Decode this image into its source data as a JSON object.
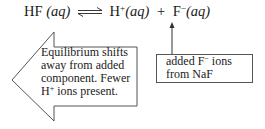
{
  "equation": {
    "reactant": "HF",
    "reactant_state": "(aq)",
    "equilibrium_symbol": "double-harpoon",
    "product1": "H",
    "product1_charge": "+",
    "product1_state": "(aq)",
    "plus": "+",
    "product2": "F",
    "product2_charge": "−",
    "product2_state": "(aq)"
  },
  "shift_arrow": {
    "direction": "left",
    "line1": "Equilibrium shifts",
    "line2": "away from added",
    "line3": "component. Fewer",
    "line4_prefix": "H",
    "line4_charge": "+",
    "line4_suffix": " ions present."
  },
  "added_box": {
    "line1_prefix": "added F",
    "line1_charge": "−",
    "line1_suffix": " ions",
    "line2": "from NaF"
  },
  "colors": {
    "stroke": "#555555",
    "text": "#1a1a1a",
    "background": "#ffffff"
  }
}
